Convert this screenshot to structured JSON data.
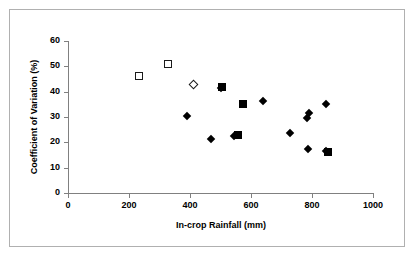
{
  "chart_data": {
    "type": "scatter",
    "title": "",
    "xlabel": "In-crop Rainfall (mm)",
    "ylabel": "Coefficient of Variation (%)",
    "xlim": [
      0,
      1000
    ],
    "ylim": [
      0,
      60
    ],
    "xticks": [
      0,
      200,
      400,
      600,
      800,
      1000
    ],
    "yticks": [
      0,
      10,
      20,
      30,
      40,
      50,
      60
    ],
    "xtick_labels": [
      "0",
      "200",
      "400",
      "600",
      "800",
      "1000"
    ],
    "ytick_labels": [
      "0",
      "10",
      "20",
      "30",
      "40",
      "50",
      "60"
    ],
    "grid": false,
    "legend": false,
    "legend_position": "none",
    "series": [
      {
        "name": "open-square",
        "marker": "open-square",
        "points": [
          {
            "x": 233,
            "y": 46
          },
          {
            "x": 328,
            "y": 51
          }
        ]
      },
      {
        "name": "open-diamond",
        "marker": "open-diamond",
        "points": [
          {
            "x": 413,
            "y": 43
          }
        ]
      },
      {
        "name": "filled-square",
        "marker": "filled-square",
        "points": [
          {
            "x": 505,
            "y": 42
          },
          {
            "x": 557,
            "y": 23
          },
          {
            "x": 573,
            "y": 35
          },
          {
            "x": 852,
            "y": 16
          }
        ]
      },
      {
        "name": "filled-diamond",
        "marker": "filled-diamond",
        "points": [
          {
            "x": 390,
            "y": 30.5
          },
          {
            "x": 470,
            "y": 21.5
          },
          {
            "x": 500,
            "y": 41.5
          },
          {
            "x": 545,
            "y": 22.5
          },
          {
            "x": 638,
            "y": 36.5
          },
          {
            "x": 727,
            "y": 23.5
          },
          {
            "x": 785,
            "y": 29.5
          },
          {
            "x": 790,
            "y": 31.5
          },
          {
            "x": 787,
            "y": 17.5
          },
          {
            "x": 845,
            "y": 35
          },
          {
            "x": 847,
            "y": 16.5
          }
        ]
      }
    ]
  },
  "axes": {
    "y_title": "Coefficient of Variation (%)",
    "x_title": "In-crop Rainfall (mm)",
    "y_ticks": [
      "60",
      "50",
      "40",
      "30",
      "20",
      "10",
      "0"
    ],
    "x_ticks": [
      "0",
      "200",
      "400",
      "600",
      "800",
      "1000"
    ]
  }
}
